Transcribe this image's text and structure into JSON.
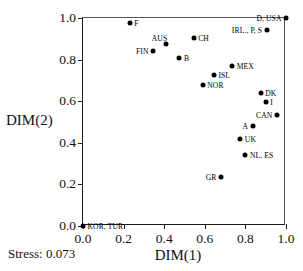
{
  "chart_data": {
    "type": "scatter",
    "title": "",
    "xlabel": "DIM(1)",
    "ylabel": "DIM(2)",
    "xlim": [
      0.0,
      1.0
    ],
    "ylim": [
      0.0,
      1.0
    ],
    "xticks": [
      "0.0",
      "0.2",
      "0.4",
      "0.6",
      "0.8",
      "1.0"
    ],
    "yticks": [
      "0.0",
      "0.2",
      "0.4",
      "0.6",
      "0.8",
      "1.0"
    ],
    "xtick_values": [
      0.0,
      0.2,
      0.4,
      0.6,
      0.8,
      1.0
    ],
    "ytick_values": [
      0.0,
      0.2,
      0.4,
      0.6,
      0.8,
      1.0
    ],
    "grid": false,
    "legend": "none",
    "marker_color": "#000000",
    "axis_color": "#1a1a1a",
    "annotation": "Stress: 0.073",
    "points": [
      {
        "label": "KOR, TUR",
        "x": 0.0,
        "y": 0.0,
        "pos": "right"
      },
      {
        "label": "F",
        "x": 0.23,
        "y": 0.975,
        "pos": "right"
      },
      {
        "label": "FIN",
        "x": 0.345,
        "y": 0.84,
        "pos": "left"
      },
      {
        "label": "AUS",
        "x": 0.41,
        "y": 0.875,
        "pos": "topleft"
      },
      {
        "label": "B",
        "x": 0.475,
        "y": 0.81,
        "pos": "right"
      },
      {
        "label": "CH",
        "x": 0.545,
        "y": 0.905,
        "pos": "right"
      },
      {
        "label": "NOR",
        "x": 0.59,
        "y": 0.68,
        "pos": "right"
      },
      {
        "label": "ISL",
        "x": 0.645,
        "y": 0.725,
        "pos": "right"
      },
      {
        "label": "GR",
        "x": 0.68,
        "y": 0.235,
        "pos": "left"
      },
      {
        "label": "MEX",
        "x": 0.735,
        "y": 0.77,
        "pos": "right"
      },
      {
        "label": "UK",
        "x": 0.775,
        "y": 0.42,
        "pos": "right"
      },
      {
        "label": "NL, ES",
        "x": 0.8,
        "y": 0.34,
        "pos": "right"
      },
      {
        "label": "A",
        "x": 0.835,
        "y": 0.48,
        "pos": "left"
      },
      {
        "label": "DK",
        "x": 0.875,
        "y": 0.64,
        "pos": "right"
      },
      {
        "label": "I",
        "x": 0.9,
        "y": 0.595,
        "pos": "right"
      },
      {
        "label": "IRL., P, S",
        "x": 0.905,
        "y": 0.94,
        "pos": "left"
      },
      {
        "label": "CAN",
        "x": 0.955,
        "y": 0.535,
        "pos": "left"
      },
      {
        "label": "D, USA",
        "x": 1.0,
        "y": 1.0,
        "pos": "left"
      }
    ]
  }
}
